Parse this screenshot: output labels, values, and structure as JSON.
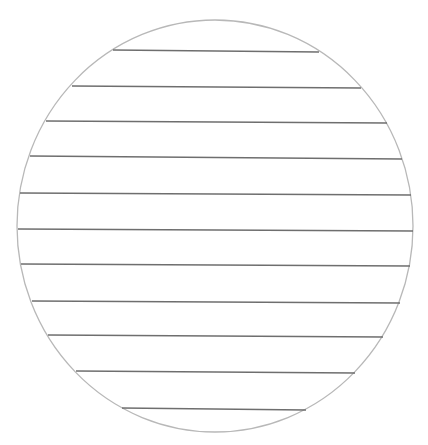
{
  "diagram": {
    "type": "lined-circle",
    "background": "#ffffff",
    "circle": {
      "cx": 215,
      "cy": 226,
      "rx": 198,
      "ry": 206,
      "stroke": "#b8b8b8",
      "stroke_width": 1.3
    },
    "line_color": "#6e6e6e",
    "line_width": 1.3,
    "lines": [
      {
        "y1": 50,
        "y2": 52,
        "x1": 113,
        "x2": 319
      },
      {
        "y1": 86,
        "y2": 88,
        "x1": 72,
        "x2": 361
      },
      {
        "y1": 121,
        "y2": 123,
        "x1": 46,
        "x2": 387
      },
      {
        "y1": 156,
        "y2": 159,
        "x1": 30,
        "x2": 402
      },
      {
        "y1": 193,
        "y2": 195,
        "x1": 20,
        "x2": 411
      },
      {
        "y1": 229,
        "y2": 231,
        "x1": 18,
        "x2": 413
      },
      {
        "y1": 264,
        "y2": 266,
        "x1": 21,
        "x2": 410
      },
      {
        "y1": 301,
        "y2": 303,
        "x1": 32,
        "x2": 400
      },
      {
        "y1": 335,
        "y2": 337,
        "x1": 48,
        "x2": 383
      },
      {
        "y1": 371,
        "y2": 373,
        "x1": 76,
        "x2": 355
      },
      {
        "y1": 408,
        "y2": 410,
        "x1": 122,
        "x2": 306
      }
    ]
  }
}
